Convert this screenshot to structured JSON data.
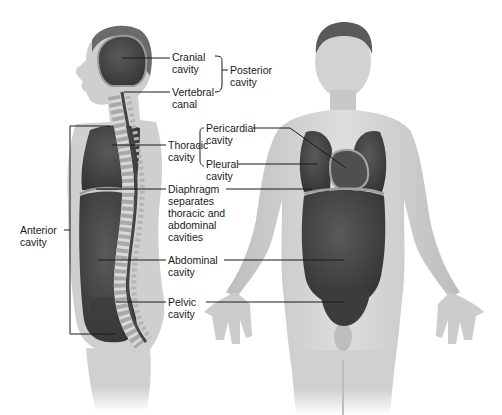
{
  "figure": {
    "colors": {
      "background": "#ffffff",
      "skin": "#d6d6d6",
      "skin_shade": "#b8b8b8",
      "cavity": "#4a4a4a",
      "cavity_dark": "#353535",
      "membrane": "#9a9a9a",
      "spine": "#c9c9c9",
      "leader_line": "#1a1a1a"
    }
  },
  "labels": {
    "cranial_cavity": "Cranial\ncavity",
    "vertebral_canal": "Vertebral\ncanal",
    "posterior_cavity": "Posterior\ncavity",
    "thoracic_cavity": "Thoracic\ncavity",
    "pericardial_cavity": "Pericardial\ncavity",
    "pleural_cavity": "Pleural\ncavity",
    "diaphragm": "Diaphragm\nseparates\nthoracic and\nabdominal\ncavities",
    "anterior_cavity": "Anterior\ncavity",
    "abdominal_cavity": "Abdominal\ncavity",
    "pelvic_cavity": "Pelvic\ncavity"
  }
}
